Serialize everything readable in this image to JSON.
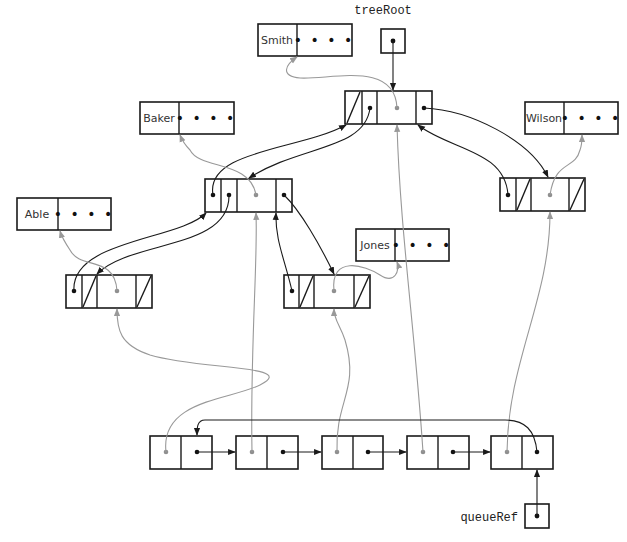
{
  "diagram": {
    "variables": {
      "tree_root": "treeRoot",
      "queue_ref": "queueRef"
    },
    "records": {
      "smith": {
        "key": "Smith",
        "rest": "• • • •"
      },
      "baker": {
        "key": "Baker",
        "rest": "• • • •"
      },
      "wilson": {
        "key": "Wilson",
        "rest": "• • • •"
      },
      "able": {
        "key": "Able",
        "rest": "• • • •"
      },
      "jones": {
        "key": "Jones",
        "rest": "• • • •"
      }
    },
    "tree_nodes": [
      {
        "id": "root",
        "data": "Smith",
        "parent": null,
        "left": "baker",
        "right": "wilson"
      },
      {
        "id": "baker",
        "data": "Baker",
        "parent": "root",
        "left": "able",
        "right": "jones"
      },
      {
        "id": "wilson",
        "data": "Wilson",
        "parent": "root",
        "left": null,
        "right": null
      },
      {
        "id": "able",
        "data": "Able",
        "parent": "baker",
        "left": null,
        "right": null
      },
      {
        "id": "jones",
        "data": "Jones",
        "parent": "baker",
        "left": null,
        "right": null
      }
    ],
    "queue_nodes": [
      {
        "index": 1,
        "item": "able"
      },
      {
        "index": 2,
        "item": "baker"
      },
      {
        "index": 3,
        "item": "jones"
      },
      {
        "index": 4,
        "item": "root"
      },
      {
        "index": 5,
        "item": "wilson"
      }
    ],
    "queue_circular": true,
    "colors": {
      "stroke": "#1a1a1a",
      "data_link": "#999999"
    }
  }
}
